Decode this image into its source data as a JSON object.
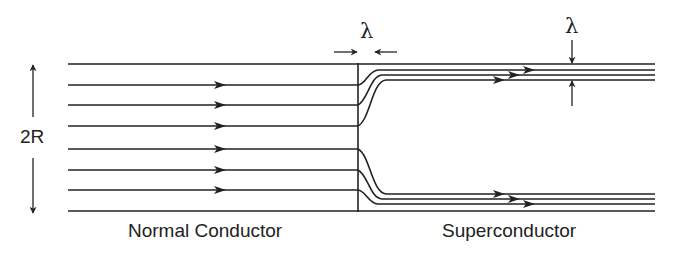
{
  "diagram": {
    "labels": {
      "left_region": "Normal Conductor",
      "right_region": "Superconductor",
      "width_dimension": "2R",
      "penetration_depth_horizontal": "λ",
      "penetration_depth_vertical": "λ"
    },
    "colors": {
      "line": "#222222",
      "background": "#ffffff"
    },
    "geometry": {
      "left_x_start": 68,
      "interface_x": 358,
      "right_x_end": 655,
      "boundary_top_y": 64,
      "boundary_bottom_y": 211,
      "normal_current_lines_y": [
        85,
        105,
        126,
        149,
        170,
        190
      ],
      "super_top_lines_y": [
        70,
        75,
        80
      ],
      "super_bottom_lines_y": [
        194,
        199,
        204
      ]
    }
  }
}
